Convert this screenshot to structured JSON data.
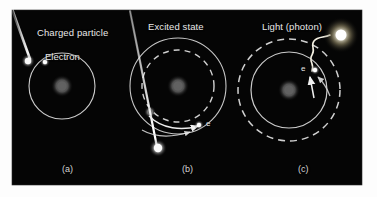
{
  "figure": {
    "background_color": "#000000",
    "frame_color": "#fdfdfd",
    "label_color": "#e8e8e8",
    "orbit_color": "#d9d9d9",
    "nucleus_color": "#5a5a5a",
    "particle_color": "#ffffff",
    "photon_color": "#fff8e0"
  },
  "panels": [
    {
      "id": "a",
      "panel_label": "(a)",
      "panel_label_x": 62,
      "panel_label_y": 170,
      "title": "Charged particle",
      "title_x": 37,
      "title_y": 28,
      "subtitle": "Electron",
      "subtitle_x": 45,
      "subtitle_y": 52,
      "nucleus": {
        "x": 62,
        "y": 86,
        "r": 6
      },
      "orbits": [
        {
          "style": "solid",
          "r": 33
        }
      ],
      "electron": {
        "x": 41,
        "y": 61,
        "r": 2.4
      },
      "incoming_particle": {
        "from_x": 10,
        "from_y": 8,
        "to_x": 29,
        "to_y": 60,
        "head_r": 3.4
      }
    },
    {
      "id": "b",
      "panel_label": "(b)",
      "panel_label_x": 182,
      "panel_label_y": 170,
      "title": "Excited state",
      "title_x": 148,
      "title_y": 22,
      "subtitle": "e",
      "subtitle_x": 206,
      "subtitle_y": 120,
      "nucleus": {
        "x": 178,
        "y": 86,
        "r": 6
      },
      "orbits": [
        {
          "style": "solid",
          "r": 48
        },
        {
          "style": "dashed",
          "r": 36
        }
      ],
      "electron": {
        "x": 199,
        "y": 125,
        "r": 2.4
      },
      "incoming_particle": {
        "from_x": 130,
        "from_y": 3,
        "to_x": 158,
        "to_y": 148,
        "head_r": 4.2
      },
      "arrow": {
        "label": "electron-ejection-arrow"
      }
    },
    {
      "id": "c",
      "panel_label": "(c)",
      "panel_label_x": 298,
      "panel_label_y": 170,
      "title": "Light (photon)",
      "title_x": 262,
      "title_y": 22,
      "subtitle": "e",
      "subtitle_x": 301,
      "subtitle_y": 66,
      "nucleus": {
        "x": 289,
        "y": 90,
        "r": 6
      },
      "orbits": [
        {
          "style": "dashed",
          "r": 51
        },
        {
          "style": "solid",
          "r": 38
        }
      ],
      "electron": {
        "x": 315,
        "y": 70,
        "r": 2.4
      },
      "photon_source": {
        "x": 341,
        "y": 35,
        "r": 7
      },
      "arrow": {
        "label": "electron-relaxation-arrow"
      }
    }
  ]
}
